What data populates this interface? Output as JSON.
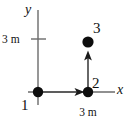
{
  "figure": {
    "background_color": "#ffffff",
    "stroke_color": "#4d4d4d",
    "axis_color": "#666666",
    "dot_color": "#000000",
    "text_color": "#111111",
    "width_px": 129,
    "height_px": 121
  },
  "axes": {
    "x_label": "x",
    "y_label": "y",
    "origin": {
      "x": 38,
      "y": 92
    },
    "x_axis": {
      "x1": 28,
      "y1": 92,
      "x2": 115,
      "y2": 92
    },
    "y_axis": {
      "x1": 38,
      "y1": 10,
      "x2": 38,
      "y2": 105
    },
    "y_tick": {
      "label": "3 m",
      "x1": 31,
      "x2": 46,
      "y": 39
    }
  },
  "points": [
    {
      "label": "1",
      "x": 38,
      "y": 92,
      "radius": 5.2,
      "label_x": 21,
      "label_y": 109
    },
    {
      "label": "2",
      "x": 88,
      "y": 92,
      "radius": 5.2,
      "label_x": 93,
      "label_y": 88
    },
    {
      "label": "3",
      "x": 88,
      "y": 42,
      "radius": 5.6,
      "label_x": 94,
      "label_y": 35
    }
  ],
  "vectors": [
    {
      "name": "horizontal-displacement",
      "from": "1",
      "to": "2",
      "length_label": "3 m",
      "label_x": 88,
      "label_y": 114,
      "x1": 40,
      "y1": 92,
      "x2": 85,
      "y2": 92
    },
    {
      "name": "vertical-displacement",
      "from": "2",
      "to": "3",
      "length_label": "",
      "x1": 88,
      "y1": 90,
      "x2": 88,
      "y2": 51
    }
  ],
  "annotations": {
    "y_tick_label": "3 m",
    "x_segment_label": "3 m"
  }
}
